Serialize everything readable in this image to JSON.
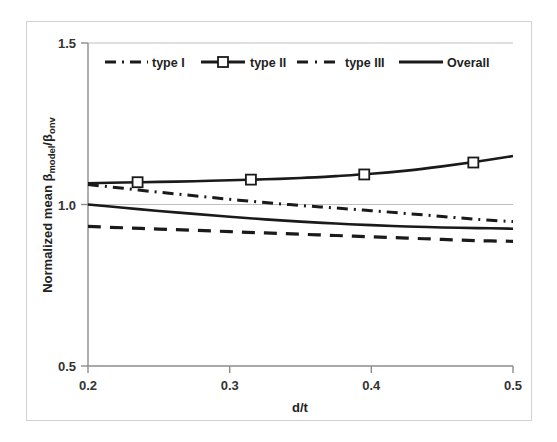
{
  "chart_data": {
    "type": "line",
    "title": "",
    "subtitle": "",
    "xlabel": "d/t",
    "ylabel": "Normalized mean βmodel/βonv",
    "ylabel_parts": {
      "prefix": "Normalized mean β",
      "sub1": "model",
      "slash": "/β",
      "sub2": "onv"
    },
    "xlim": [
      0.2,
      0.5
    ],
    "ylim": [
      0.5,
      1.5
    ],
    "xticks": [
      0.2,
      0.3,
      0.4,
      0.5
    ],
    "xtick_labels": [
      "0.2",
      "0.3",
      "0.4",
      "0.5"
    ],
    "yticks": [
      0.5,
      1.0,
      1.5
    ],
    "ytick_labels": [
      "0.5",
      "1.0",
      "1.5"
    ],
    "grid": true,
    "gridlines_y": [
      1.0,
      1.5
    ],
    "legend_position": "top-inside",
    "series": [
      {
        "name": "type I",
        "style": "dashed",
        "marker": "none",
        "color": "#1a1a1a",
        "x": [
          0.2,
          0.225,
          0.25,
          0.275,
          0.3,
          0.325,
          0.35,
          0.375,
          0.4,
          0.425,
          0.45,
          0.475,
          0.5
        ],
        "values": [
          0.932,
          0.928,
          0.924,
          0.92,
          0.916,
          0.912,
          0.908,
          0.904,
          0.9,
          0.896,
          0.892,
          0.888,
          0.886
        ]
      },
      {
        "name": "type II",
        "style": "solid",
        "marker": "square-open",
        "color": "#1a1a1a",
        "x": [
          0.2,
          0.225,
          0.25,
          0.275,
          0.3,
          0.325,
          0.35,
          0.375,
          0.4,
          0.425,
          0.45,
          0.475,
          0.5
        ],
        "values": [
          1.066,
          1.068,
          1.07,
          1.072,
          1.075,
          1.078,
          1.082,
          1.088,
          1.095,
          1.105,
          1.118,
          1.133,
          1.15
        ],
        "marker_x": [
          0.235,
          0.315,
          0.395,
          0.472
        ],
        "marker_values": [
          1.069,
          1.077,
          1.093,
          1.13
        ]
      },
      {
        "name": "type III",
        "style": "dash-dot",
        "marker": "none",
        "color": "#1a1a1a",
        "x": [
          0.2,
          0.225,
          0.25,
          0.275,
          0.3,
          0.325,
          0.35,
          0.375,
          0.4,
          0.425,
          0.45,
          0.475,
          0.5
        ],
        "values": [
          1.062,
          1.05,
          1.038,
          1.027,
          1.016,
          1.006,
          0.997,
          0.989,
          0.981,
          0.972,
          0.963,
          0.954,
          0.947
        ]
      },
      {
        "name": "Overall",
        "style": "solid",
        "marker": "none",
        "color": "#1a1a1a",
        "x": [
          0.2,
          0.225,
          0.25,
          0.275,
          0.3,
          0.325,
          0.35,
          0.375,
          0.4,
          0.425,
          0.45,
          0.475,
          0.5
        ],
        "values": [
          1.0,
          0.99,
          0.98,
          0.971,
          0.962,
          0.954,
          0.947,
          0.941,
          0.936,
          0.932,
          0.929,
          0.927,
          0.925
        ]
      }
    ],
    "legend": [
      {
        "label": "type I",
        "style": "dashed",
        "marker": "none"
      },
      {
        "label": "type II",
        "style": "solid",
        "marker": "square-open"
      },
      {
        "label": "type III",
        "style": "dash-dot",
        "marker": "none"
      },
      {
        "label": "Overall",
        "style": "solid",
        "marker": "none"
      }
    ],
    "colors": {
      "line": "#1a1a1a",
      "axis": "#8c8c8c",
      "grid": "#bfbfbf",
      "text": "#333333",
      "frame": "#d2d2d2",
      "background": "#ffffff"
    }
  }
}
